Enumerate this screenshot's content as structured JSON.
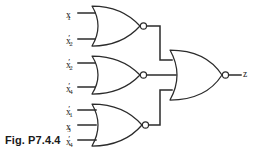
{
  "figure": {
    "caption": "Fig. P7.4.4",
    "background_color": "#ffffff",
    "line_color": "#2b2b2b",
    "width": 253,
    "height": 158
  },
  "diagram": {
    "type": "logic-circuit",
    "gate_type": "NOR",
    "gates": [
      {
        "id": "gate-1",
        "type": "NOR",
        "inputs": [
          "x1",
          "x2prime"
        ],
        "input_count": 2,
        "output_to": "gate-4"
      },
      {
        "id": "gate-2",
        "type": "NOR",
        "inputs": [
          "x2prime",
          "x4prime"
        ],
        "input_count": 2,
        "output_to": "gate-4"
      },
      {
        "id": "gate-3",
        "type": "NOR",
        "inputs": [
          "x1prime",
          "x3",
          "x4prime"
        ],
        "input_count": 3,
        "output_to": "gate-4"
      },
      {
        "id": "gate-4",
        "type": "NOR",
        "inputs": [
          "gate-1",
          "gate-2",
          "gate-3"
        ],
        "input_count": 3,
        "output_to": "z"
      }
    ]
  },
  "labels": {
    "gate1_input1": {
      "base": "x",
      "sub": "1",
      "prime": ""
    },
    "gate1_input2": {
      "base": "x",
      "sub": "2",
      "prime": "′"
    },
    "gate2_input1": {
      "base": "x",
      "sub": "2",
      "prime": "′"
    },
    "gate2_input2": {
      "base": "x",
      "sub": "4",
      "prime": "′"
    },
    "gate3_input1": {
      "base": "x",
      "sub": "1",
      "prime": "′"
    },
    "gate3_input2": {
      "base": "x",
      "sub": "3",
      "prime": ""
    },
    "gate3_input3": {
      "base": "x",
      "sub": "4",
      "prime": "′"
    },
    "output": "z"
  }
}
